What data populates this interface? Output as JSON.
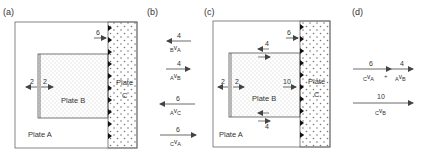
{
  "panels": {
    "a": {
      "label": "(a)",
      "plate_a": "Plate A",
      "plate_b": "Plate B",
      "plate_c_line1": "Plate",
      "plate_c_line2": "C",
      "arrow_c_value": "6",
      "arrow_left_value": "2",
      "arrow_right_value": "2"
    },
    "b": {
      "label": "(b)",
      "vectors": [
        {
          "value": "4",
          "direction": "left",
          "from": "B",
          "to": "A"
        },
        {
          "value": "4",
          "direction": "right",
          "from": "A",
          "to": "B"
        },
        {
          "value": "6",
          "direction": "left",
          "from": "A",
          "to": "C"
        },
        {
          "value": "6",
          "direction": "right",
          "from": "C",
          "to": "A"
        }
      ]
    },
    "c": {
      "label": "(c)",
      "plate_a": "Plate A",
      "plate_b": "Plate B",
      "plate_c_line1": "Plate",
      "plate_c_line2": "C",
      "arrow_c_value": "6",
      "arrow_top_value": "4",
      "arrow_bottom_value": "4",
      "arrow_left_value": "2",
      "arrow_right_value": "2",
      "arrow_b_value": "10"
    },
    "d": {
      "label": "(d)",
      "sum": [
        {
          "value": "6",
          "from": "C",
          "to": "A"
        },
        {
          "value": "4",
          "from": "A",
          "to": "B"
        }
      ],
      "plus": "+",
      "result": {
        "value": "10",
        "from": "C",
        "to": "B"
      }
    }
  },
  "colors": {
    "line": "#555555",
    "text": "#333333",
    "dots": "#888888",
    "triangles": "#111111"
  }
}
